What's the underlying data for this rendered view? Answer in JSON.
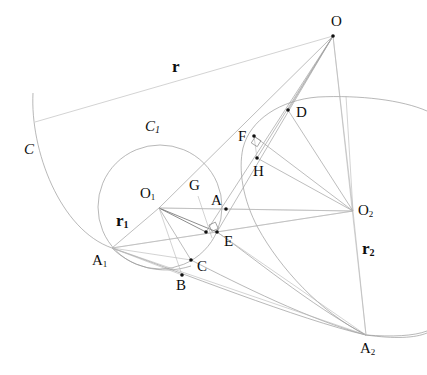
{
  "figure": {
    "background_color": "#ffffff",
    "stroke_color": "#9a9a9a",
    "label_color": "#0d0d0d",
    "width": 427,
    "height": 375
  },
  "points": [
    {
      "id": "O",
      "label": "O",
      "x": 333,
      "y": 36,
      "label_x": 331,
      "label_y": 14,
      "dot": true
    },
    {
      "id": "D",
      "label": "D",
      "x": 288,
      "y": 110,
      "label_x": 296,
      "label_y": 105,
      "dot": true
    },
    {
      "id": "F",
      "label": "F",
      "x": 254,
      "y": 136,
      "label_x": 238,
      "label_y": 129,
      "dot": true
    },
    {
      "id": "H",
      "label": "H",
      "x": 257,
      "y": 158,
      "label_x": 253,
      "label_y": 164,
      "dot": true
    },
    {
      "id": "O1",
      "label": "O",
      "sub": "1",
      "x": 159,
      "y": 208,
      "label_x": 140,
      "label_y": 186,
      "dot": false
    },
    {
      "id": "G",
      "label": "G",
      "x": 198,
      "y": 196,
      "label_x": 189,
      "label_y": 178,
      "dot": false
    },
    {
      "id": "A",
      "label": "A",
      "x": 226,
      "y": 209,
      "label_x": 211,
      "label_y": 193,
      "dot": true
    },
    {
      "id": "O2",
      "label": "O",
      "sub": "2",
      "x": 353,
      "y": 211,
      "label_x": 358,
      "label_y": 203,
      "dot": false
    },
    {
      "id": "E",
      "label": "E",
      "x": 217,
      "y": 232,
      "label_x": 224,
      "label_y": 234,
      "dot": true
    },
    {
      "id": "E2",
      "label": "",
      "x": 206,
      "y": 232,
      "label_x": 0,
      "label_y": 0,
      "dot": true
    },
    {
      "id": "A1",
      "label": "A",
      "sub": "1",
      "x": 112,
      "y": 248,
      "label_x": 92,
      "label_y": 253,
      "dot": false
    },
    {
      "id": "C",
      "label": "C",
      "x": 191,
      "y": 260,
      "label_x": 197,
      "label_y": 259,
      "dot": true
    },
    {
      "id": "B",
      "label": "B",
      "x": 182,
      "y": 275,
      "label_x": 176,
      "label_y": 278,
      "dot": true
    },
    {
      "id": "A2",
      "label": "A",
      "sub": "2",
      "x": 366,
      "y": 335,
      "label_x": 360,
      "label_y": 341,
      "dot": false
    }
  ],
  "curve_labels": [
    {
      "id": "C",
      "label": "C",
      "sub": "",
      "x": 24,
      "y": 142
    },
    {
      "id": "C1",
      "label": "C",
      "sub": "1",
      "x": 145,
      "y": 119
    }
  ],
  "radius_labels": [
    {
      "id": "r",
      "label": "r",
      "sub": "",
      "x": 172,
      "y": 58
    },
    {
      "id": "r1",
      "label": "r",
      "sub": "1",
      "x": 116,
      "y": 212
    },
    {
      "id": "r2",
      "label": "r",
      "sub": "2",
      "x": 362,
      "y": 240
    }
  ],
  "curves": {
    "arc_C": "M 33 93 C 30 150, 60 230, 112 248 C 175 270, 300 320, 366 335 C 395 339, 415 338, 427 333",
    "arc_C_right_tail": "M 366 335 C 392 337, 414 336, 427 331",
    "circle_C1": {
      "cx": 160,
      "cy": 207,
      "r": 62
    },
    "arc_C2_top": "M 243 148 C 250 120, 280 100, 318 97 C 360 95, 402 100, 427 111",
    "arc_C2_left": "M 243 148 C 238 170, 243 200, 258 228 C 280 268, 320 312, 366 335",
    "arc_inner_right": "M 217 232 C 250 255, 310 305, 366 335",
    "arc_inner_low": "M 191 260 C 240 285, 310 320, 366 335",
    "arc_small_left": "M 112 248 C 130 266, 160 276, 191 266"
  },
  "segments": [
    {
      "id": "O-A1-tangent",
      "x1": 35,
      "y1": 122,
      "x2": 333,
      "y2": 36,
      "weight": "faint"
    },
    {
      "id": "O-O1",
      "x1": 333,
      "y1": 36,
      "x2": 159,
      "y2": 208,
      "weight": "normal"
    },
    {
      "id": "O-E",
      "x1": 333,
      "y1": 36,
      "x2": 217,
      "y2": 232,
      "weight": "normal"
    },
    {
      "id": "O-E2",
      "x1": 333,
      "y1": 36,
      "x2": 206,
      "y2": 232,
      "weight": "normal"
    },
    {
      "id": "O-H",
      "x1": 333,
      "y1": 36,
      "x2": 257,
      "y2": 158,
      "weight": "normal"
    },
    {
      "id": "O-D",
      "x1": 333,
      "y1": 36,
      "x2": 288,
      "y2": 110,
      "weight": "normal"
    },
    {
      "id": "O-A2",
      "x1": 333,
      "y1": 36,
      "x2": 366,
      "y2": 335,
      "weight": "faint"
    },
    {
      "id": "O-O2",
      "x1": 333,
      "y1": 36,
      "x2": 353,
      "y2": 211,
      "weight": "faint"
    },
    {
      "id": "D-O2",
      "x1": 288,
      "y1": 110,
      "x2": 353,
      "y2": 211,
      "weight": "normal"
    },
    {
      "id": "F-O2",
      "x1": 254,
      "y1": 136,
      "x2": 353,
      "y2": 211,
      "weight": "normal"
    },
    {
      "id": "H-O2",
      "x1": 257,
      "y1": 158,
      "x2": 353,
      "y2": 211,
      "weight": "normal"
    },
    {
      "id": "O1-O2",
      "x1": 159,
      "y1": 208,
      "x2": 353,
      "y2": 211,
      "weight": "faint"
    },
    {
      "id": "O1-A1",
      "x1": 159,
      "y1": 208,
      "x2": 112,
      "y2": 248,
      "weight": "normal"
    },
    {
      "id": "O1-E",
      "x1": 159,
      "y1": 208,
      "x2": 217,
      "y2": 232,
      "weight": "dark"
    },
    {
      "id": "O1-E2",
      "x1": 159,
      "y1": 208,
      "x2": 206,
      "y2": 232,
      "weight": "dark"
    },
    {
      "id": "O1-C",
      "x1": 159,
      "y1": 208,
      "x2": 191,
      "y2": 260,
      "weight": "normal"
    },
    {
      "id": "O1-B",
      "x1": 159,
      "y1": 208,
      "x2": 182,
      "y2": 275,
      "weight": "faint"
    },
    {
      "id": "A1-E",
      "x1": 112,
      "y1": 248,
      "x2": 217,
      "y2": 232,
      "weight": "faint"
    },
    {
      "id": "A1-O2",
      "x1": 112,
      "y1": 248,
      "x2": 353,
      "y2": 211,
      "weight": "faint"
    },
    {
      "id": "A1-C",
      "x1": 112,
      "y1": 248,
      "x2": 191,
      "y2": 260,
      "weight": "faint"
    },
    {
      "id": "A1-A2",
      "x1": 112,
      "y1": 248,
      "x2": 366,
      "y2": 335,
      "weight": "faint"
    },
    {
      "id": "A1-B",
      "x1": 112,
      "y1": 248,
      "x2": 182,
      "y2": 275,
      "weight": "faint"
    },
    {
      "id": "G-E",
      "x1": 198,
      "y1": 196,
      "x2": 212,
      "y2": 238,
      "weight": "faint"
    },
    {
      "id": "A-O2",
      "x1": 226,
      "y1": 209,
      "x2": 353,
      "y2": 211,
      "weight": "faint"
    },
    {
      "id": "O1-A",
      "x1": 159,
      "y1": 208,
      "x2": 226,
      "y2": 209,
      "weight": "faint"
    },
    {
      "id": "E-O2",
      "x1": 217,
      "y1": 232,
      "x2": 353,
      "y2": 211,
      "weight": "faint"
    },
    {
      "id": "F-H",
      "x1": 254,
      "y1": 136,
      "x2": 257,
      "y2": 158,
      "weight": "faint"
    },
    {
      "id": "O2-A2",
      "x1": 353,
      "y1": 211,
      "x2": 366,
      "y2": 335,
      "weight": "faint"
    },
    {
      "id": "O2-vert-top",
      "x1": 353,
      "y1": 211,
      "x2": 346,
      "y2": 96,
      "weight": "faint"
    },
    {
      "id": "E-A2",
      "x1": 217,
      "y1": 232,
      "x2": 366,
      "y2": 335,
      "weight": "faint"
    }
  ],
  "right_angle_marks": [
    {
      "id": "ra-E",
      "x": 209,
      "y": 225,
      "size": 7,
      "rotate": -24
    },
    {
      "id": "ra-F",
      "x": 255,
      "y": 137,
      "size": 7,
      "rotate": 32
    }
  ]
}
